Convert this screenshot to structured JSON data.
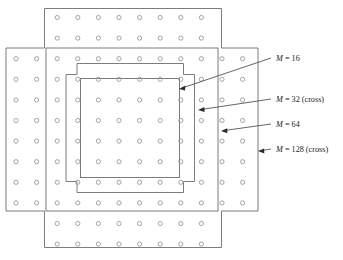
{
  "figure": {
    "type": "constellation-diagram",
    "background_color": "#ffffff",
    "line_color": "#6e6e6e",
    "symbol_color": "#8a8a8a",
    "text_color": "#1b1b1b"
  },
  "grid": {
    "symbol_shape": "circle",
    "symbol_radius": 2.1,
    "spacing_x": 20.6,
    "spacing_y": 20.6,
    "origin_x": 57.5,
    "origin_y": 17.5,
    "columns_middle": 12,
    "rows_middle": 8,
    "columns_arm": 8,
    "rows_arm": 2,
    "total_points": 128,
    "column_start_x": 16.0,
    "row_start_y": 17.5
  },
  "regions": [
    {
      "id": "m16",
      "label": "M = 16",
      "label_plain": "M = 16",
      "m_value": 16,
      "shape": "square",
      "points": 16,
      "arrow_label_x": 276,
      "arrow_label_y": 60,
      "arrow_tip_x": 179,
      "arrow_tip_y": 89,
      "arrow_tail_x": 271,
      "arrow_tail_y": 58,
      "box": {
        "x": 80.5,
        "y": 78.5,
        "w": 99.0,
        "h": 99.0
      }
    },
    {
      "id": "m32",
      "label": "M = 32 (cross)",
      "label_plain": "M = 32 (cross)",
      "m_value": 32,
      "shape": "cross",
      "points": 32,
      "arrow_label_x": 276,
      "arrow_label_y": 101,
      "arrow_tip_x": 198,
      "arrow_tip_y": 110,
      "arrow_tail_x": 271,
      "arrow_tail_y": 99,
      "box": {
        "x": 66.0,
        "y": 63.5,
        "w": 128.5,
        "h": 129.0,
        "notch": 11.0
      }
    },
    {
      "id": "m64",
      "label": "M = 64",
      "label_plain": "M = 64",
      "m_value": 64,
      "shape": "square",
      "points": 64,
      "arrow_label_x": 276,
      "arrow_label_y": 126,
      "arrow_tip_x": 221,
      "arrow_tip_y": 131,
      "arrow_tail_x": 271,
      "arrow_tail_y": 124,
      "box": {
        "x": 46.0,
        "y": 48.0,
        "w": 172.0,
        "h": 163.0
      }
    },
    {
      "id": "m128",
      "label": "M = 128 (cross)",
      "label_plain": "M = 128 (cross)",
      "m_value": 128,
      "shape": "cross",
      "points": 128,
      "arrow_label_x": 276,
      "arrow_label_y": 150,
      "arrow_tip_x": 258,
      "arrow_tip_y": 151,
      "arrow_tail_x": 271,
      "arrow_tail_y": 149,
      "box": {
        "x": 5.5,
        "y": 8.0,
        "w": 253.0,
        "h": 240.0
      }
    }
  ],
  "labels": {
    "m16": {
      "m": "M",
      "rest": " = 16"
    },
    "m32": {
      "m": "M",
      "rest": " = 32 (cross)"
    },
    "m64": {
      "m": "M",
      "rest": " = 64"
    },
    "m128": {
      "m": "M",
      "rest": " = 128 (cross)"
    }
  }
}
